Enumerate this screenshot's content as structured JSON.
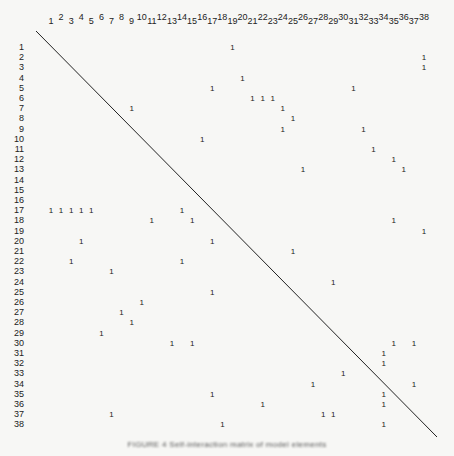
{
  "figure": {
    "type": "binary-adjacency-matrix",
    "size": 38,
    "column_labels": [
      "1",
      "2",
      "3",
      "4",
      "5",
      "6",
      "7",
      "8",
      "9",
      "10",
      "11",
      "12",
      "13",
      "14",
      "15",
      "16",
      "17",
      "18",
      "19",
      "20",
      "21",
      "22",
      "23",
      "24",
      "25",
      "26",
      "27",
      "28",
      "29",
      "30",
      "31",
      "32",
      "33",
      "34",
      "35",
      "36",
      "37",
      "38"
    ],
    "row_labels": [
      "1",
      "2",
      "3",
      "4",
      "5",
      "6",
      "7",
      "8",
      "9",
      "10",
      "11",
      "12",
      "13",
      "14",
      "15",
      "16",
      "17",
      "18",
      "19",
      "20",
      "21",
      "22",
      "23",
      "24",
      "25",
      "26",
      "27",
      "28",
      "29",
      "30",
      "31",
      "32",
      "33",
      "34",
      "35",
      "36",
      "37",
      "38"
    ],
    "cell_value": "1",
    "entries": [
      {
        "row": 1,
        "cols": [
          19
        ]
      },
      {
        "row": 2,
        "cols": [
          38
        ]
      },
      {
        "row": 3,
        "cols": [
          38
        ]
      },
      {
        "row": 4,
        "cols": [
          20
        ]
      },
      {
        "row": 5,
        "cols": [
          17,
          31
        ]
      },
      {
        "row": 6,
        "cols": [
          21,
          22,
          23
        ]
      },
      {
        "row": 7,
        "cols": [
          9,
          24
        ]
      },
      {
        "row": 8,
        "cols": [
          25
        ]
      },
      {
        "row": 9,
        "cols": [
          24,
          32
        ]
      },
      {
        "row": 10,
        "cols": [
          16
        ]
      },
      {
        "row": 11,
        "cols": [
          33
        ]
      },
      {
        "row": 12,
        "cols": [
          35
        ]
      },
      {
        "row": 13,
        "cols": [
          26,
          36
        ]
      },
      {
        "row": 14,
        "cols": []
      },
      {
        "row": 15,
        "cols": []
      },
      {
        "row": 16,
        "cols": []
      },
      {
        "row": 17,
        "cols": [
          1,
          2,
          3,
          4,
          5,
          14
        ]
      },
      {
        "row": 18,
        "cols": [
          11,
          15,
          35
        ]
      },
      {
        "row": 19,
        "cols": [
          38
        ]
      },
      {
        "row": 20,
        "cols": [
          4,
          17
        ]
      },
      {
        "row": 21,
        "cols": [
          25
        ]
      },
      {
        "row": 22,
        "cols": [
          3,
          14
        ]
      },
      {
        "row": 23,
        "cols": [
          7
        ]
      },
      {
        "row": 24,
        "cols": [
          29
        ]
      },
      {
        "row": 25,
        "cols": [
          17
        ]
      },
      {
        "row": 26,
        "cols": [
          10
        ]
      },
      {
        "row": 27,
        "cols": [
          8
        ]
      },
      {
        "row": 28,
        "cols": [
          9
        ]
      },
      {
        "row": 29,
        "cols": [
          6
        ]
      },
      {
        "row": 30,
        "cols": [
          13,
          15,
          35,
          37
        ]
      },
      {
        "row": 31,
        "cols": [
          34
        ]
      },
      {
        "row": 32,
        "cols": [
          34
        ]
      },
      {
        "row": 33,
        "cols": [
          30
        ]
      },
      {
        "row": 34,
        "cols": [
          27,
          37
        ]
      },
      {
        "row": 35,
        "cols": [
          17,
          34
        ]
      },
      {
        "row": 36,
        "cols": [
          22,
          34
        ]
      },
      {
        "row": 37,
        "cols": [
          7,
          28,
          29
        ]
      },
      {
        "row": 38,
        "cols": [
          18,
          34
        ]
      }
    ],
    "diagonal_line": true,
    "caption": "FIGURE 4  Self-interaction matrix of model elements"
  }
}
